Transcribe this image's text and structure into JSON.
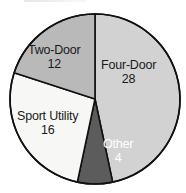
{
  "chart_data": {
    "type": "pie",
    "title": "",
    "xlabel": "",
    "ylabel": "",
    "total": 60,
    "categories": [
      "Four-Door",
      "Other",
      "Sport Utility",
      "Two-Door"
    ],
    "values": [
      28,
      4,
      16,
      12
    ],
    "slices": [
      {
        "label": "Four-Door",
        "value": 28,
        "value_text": "28",
        "percent": 46.7,
        "start_angle": 0,
        "end_angle": 168,
        "color": "#d2d2d2",
        "text_color": "#1a1a1a"
      },
      {
        "label": "Other",
        "value": 4,
        "value_text": "4",
        "percent": 6.7,
        "start_angle": 168,
        "end_angle": 192,
        "color": "#5c5c5c",
        "text_color": "#ffffff"
      },
      {
        "label": "Sport Utility",
        "value": 16,
        "value_text": "16",
        "percent": 26.7,
        "start_angle": 192,
        "end_angle": 288,
        "color": "#f7f7f5",
        "text_color": "#1a1a1a"
      },
      {
        "label": "Two-Door",
        "value": 12,
        "value_text": "12",
        "percent": 20.0,
        "start_angle": 288,
        "end_angle": 360,
        "color": "#b9b9b9",
        "text_color": "#1a1a1a"
      }
    ],
    "legend": "none",
    "grid": false,
    "outline_color": "#111111"
  },
  "geometry": {
    "center_x": 95,
    "center_y": 99,
    "radius": 85
  }
}
